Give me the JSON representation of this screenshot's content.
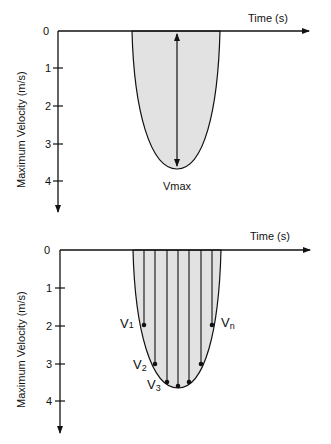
{
  "colors": {
    "fill": "#e2e2e2",
    "stroke": "#111111",
    "background": "#ffffff"
  },
  "top_panel": {
    "x_axis_label": "Time (s)",
    "y_axis_label": "Maximum Velocity (m/s)",
    "y_ticks": [
      "0",
      "1",
      "2",
      "3",
      "4"
    ],
    "annotation": "Vmax"
  },
  "bottom_panel": {
    "x_axis_label": "Time (s)",
    "y_axis_label": "Maximum Velocity (m/s)",
    "y_ticks": [
      "0",
      "1",
      "2",
      "3",
      "4"
    ],
    "labels": {
      "v1": {
        "main": "V",
        "sub": "1"
      },
      "v2": {
        "main": "V",
        "sub": "2"
      },
      "v3": {
        "main": "V",
        "sub": "3"
      },
      "vn": {
        "main": "V",
        "sub": "n"
      }
    }
  }
}
